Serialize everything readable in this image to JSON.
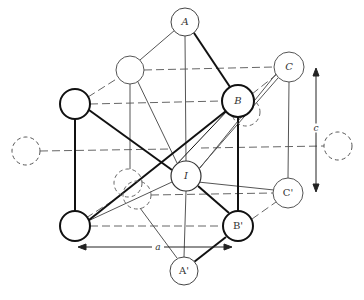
{
  "diagram": {
    "type": "crystal-lattice-unit-cell",
    "colors": {
      "stroke": "#1a1a1a",
      "thin_stroke": "#555555",
      "dashed": "#666666",
      "background": "#ffffff"
    },
    "atoms": [
      {
        "id": "A",
        "label": "A",
        "x": 185,
        "y": 22,
        "r": 14,
        "style": "thin"
      },
      {
        "id": "A2",
        "label": "A'",
        "x": 184,
        "y": 271,
        "r": 14,
        "style": "thin"
      },
      {
        "id": "B",
        "label": "B",
        "x": 238,
        "y": 101,
        "r": 16,
        "style": "bold"
      },
      {
        "id": "B2",
        "label": "B'",
        "x": 238,
        "y": 226,
        "r": 15,
        "style": "bold"
      },
      {
        "id": "C",
        "label": "C",
        "x": 289,
        "y": 67,
        "r": 15,
        "style": "thin"
      },
      {
        "id": "C2",
        "label": "C'",
        "x": 288,
        "y": 193,
        "r": 15,
        "style": "thin"
      },
      {
        "id": "I",
        "label": "I",
        "x": 186,
        "y": 176,
        "r": 15,
        "style": "thin"
      },
      {
        "id": "L1",
        "label": "",
        "x": 75,
        "y": 104,
        "r": 15,
        "style": "bold"
      },
      {
        "id": "L2",
        "label": "",
        "x": 75,
        "y": 226,
        "r": 15,
        "style": "bold"
      },
      {
        "id": "U1",
        "label": "",
        "x": 130,
        "y": 70,
        "r": 14,
        "style": "thin"
      },
      {
        "id": "DL",
        "label": "",
        "x": 26,
        "y": 151,
        "r": 14,
        "style": "dashed"
      },
      {
        "id": "DR",
        "label": "",
        "x": 338,
        "y": 146,
        "r": 14,
        "style": "dashed"
      },
      {
        "id": "D1",
        "label": "",
        "x": 128,
        "y": 183,
        "r": 14,
        "style": "dashed"
      },
      {
        "id": "D2",
        "label": "",
        "x": 137,
        "y": 195,
        "r": 14,
        "style": "dashed"
      },
      {
        "id": "D3",
        "label": "",
        "x": 246,
        "y": 112,
        "r": 14,
        "style": "dashed"
      }
    ],
    "dimensions": {
      "c": {
        "label": "c",
        "x": 316,
        "y1": 68,
        "y2": 192
      },
      "a": {
        "label": "a",
        "y": 247,
        "x1": 78,
        "x2": 232
      }
    }
  }
}
